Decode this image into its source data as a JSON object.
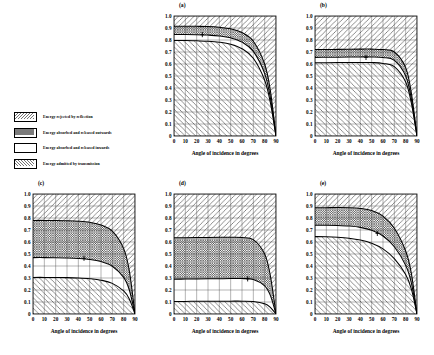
{
  "legend": {
    "items": [
      {
        "label": "Energy rejected by reflection",
        "pattern": "backslash-hatch"
      },
      {
        "label": "Energy absorbed and released outwards",
        "pattern": "cross-hatch"
      },
      {
        "label": "Energy absorbed and released inwards",
        "pattern": "solid-white"
      },
      {
        "label": "Energy admitted by transmission",
        "pattern": "forwardslash-hatch"
      }
    ]
  },
  "chart_data": [
    {
      "type": "area",
      "title": "(a)",
      "xlabel": "Angle of incidence in degrees",
      "ylabel": "",
      "xlim": [
        0,
        90
      ],
      "ylim": [
        0,
        1.0
      ],
      "xticks": [
        0,
        10,
        20,
        30,
        40,
        50,
        60,
        70,
        80,
        90
      ],
      "yticks": [
        0,
        0.1,
        0.2,
        0.3,
        0.4,
        0.5,
        0.6,
        0.7,
        0.8,
        0.9,
        1.0
      ],
      "ytick_labels": [
        "0",
        "0.1",
        "0.2",
        "0.3",
        "0.4",
        "0.5",
        "0.6",
        "0.7",
        "0.8",
        "0.9",
        "1.0"
      ],
      "grid": true,
      "x": [
        0,
        10,
        20,
        30,
        40,
        50,
        60,
        70,
        80,
        85,
        90
      ],
      "series": [
        {
          "name": "upper-boundary",
          "values": [
            0.915,
            0.915,
            0.914,
            0.912,
            0.906,
            0.893,
            0.862,
            0.79,
            0.6,
            0.38,
            0.0
          ]
        },
        {
          "name": "middle-boundary",
          "values": [
            0.845,
            0.845,
            0.844,
            0.841,
            0.834,
            0.818,
            0.782,
            0.705,
            0.52,
            0.32,
            0.0
          ]
        },
        {
          "name": "lower-boundary",
          "values": [
            0.795,
            0.795,
            0.793,
            0.79,
            0.782,
            0.765,
            0.727,
            0.648,
            0.465,
            0.28,
            0.0
          ]
        }
      ],
      "marker": {
        "x": 25,
        "y": 0.845
      }
    },
    {
      "type": "area",
      "title": "(b)",
      "xlabel": "Angle of incidence in degrees",
      "ylabel": "",
      "xlim": [
        0,
        90
      ],
      "ylim": [
        0,
        1.0
      ],
      "xticks": [
        0,
        10,
        20,
        30,
        40,
        50,
        60,
        70,
        80,
        90
      ],
      "yticks": [
        0,
        0.1,
        0.2,
        0.3,
        0.4,
        0.5,
        0.6,
        0.7,
        0.8,
        0.9,
        1.0
      ],
      "ytick_labels": [
        "0",
        "0.1",
        "0.2",
        "0.3",
        "0.4",
        "0.5",
        "0.6",
        "0.7",
        "0.8",
        "0.9",
        "1.0"
      ],
      "grid": true,
      "x": [
        0,
        10,
        20,
        30,
        40,
        50,
        60,
        70,
        80,
        85,
        90
      ],
      "series": [
        {
          "name": "upper-boundary",
          "values": [
            0.72,
            0.721,
            0.722,
            0.723,
            0.724,
            0.724,
            0.72,
            0.7,
            0.57,
            0.36,
            0.0
          ]
        },
        {
          "name": "middle-boundary",
          "values": [
            0.655,
            0.656,
            0.657,
            0.658,
            0.659,
            0.659,
            0.654,
            0.63,
            0.5,
            0.31,
            0.0
          ]
        },
        {
          "name": "lower-boundary",
          "values": [
            0.61,
            0.611,
            0.612,
            0.613,
            0.613,
            0.612,
            0.605,
            0.578,
            0.45,
            0.275,
            0.0
          ]
        }
      ],
      "marker": {
        "x": 45,
        "y": 0.655
      }
    },
    {
      "type": "area",
      "title": "(c)",
      "xlabel": "Angle of incidence in degrees",
      "ylabel": "",
      "xlim": [
        0,
        90
      ],
      "ylim": [
        0,
        1.0
      ],
      "xticks": [
        0,
        10,
        20,
        30,
        40,
        50,
        60,
        70,
        80,
        90
      ],
      "yticks": [
        0,
        0.1,
        0.2,
        0.3,
        0.4,
        0.5,
        0.6,
        0.7,
        0.8,
        0.9,
        1.0
      ],
      "ytick_labels": [
        "0",
        "0.1",
        "0.2",
        "0.3",
        "0.4",
        "0.5",
        "0.6",
        "0.7",
        "0.8",
        "0.9",
        "1.0"
      ],
      "grid": true,
      "x": [
        0,
        10,
        20,
        30,
        40,
        50,
        60,
        70,
        80,
        85,
        90
      ],
      "series": [
        {
          "name": "upper-boundary",
          "values": [
            0.78,
            0.78,
            0.779,
            0.777,
            0.773,
            0.764,
            0.742,
            0.69,
            0.545,
            0.36,
            0.0
          ]
        },
        {
          "name": "middle-boundary",
          "values": [
            0.47,
            0.47,
            0.469,
            0.467,
            0.463,
            0.455,
            0.437,
            0.398,
            0.305,
            0.2,
            0.0
          ]
        },
        {
          "name": "lower-boundary",
          "values": [
            0.305,
            0.305,
            0.304,
            0.303,
            0.3,
            0.294,
            0.282,
            0.255,
            0.192,
            0.125,
            0.0
          ]
        }
      ],
      "marker": {
        "x": 45,
        "y": 0.465
      }
    },
    {
      "type": "area",
      "title": "(d)",
      "xlabel": "Angle of incidence in degrees",
      "ylabel": "",
      "xlim": [
        0,
        90
      ],
      "ylim": [
        0,
        1.0
      ],
      "xticks": [
        0,
        10,
        20,
        30,
        40,
        50,
        60,
        70,
        80,
        90
      ],
      "yticks": [
        0,
        0.1,
        0.2,
        0.3,
        0.4,
        0.5,
        0.6,
        0.7,
        0.8,
        0.9,
        1.0
      ],
      "ytick_labels": [
        "0",
        "0.1",
        "0.2",
        "0.3",
        "0.4",
        "0.5",
        "0.6",
        "0.7",
        "0.8",
        "0.9",
        "1.0"
      ],
      "grid": true,
      "x": [
        0,
        10,
        20,
        30,
        40,
        50,
        60,
        70,
        80,
        85,
        90
      ],
      "series": [
        {
          "name": "upper-boundary",
          "values": [
            0.635,
            0.636,
            0.637,
            0.638,
            0.639,
            0.639,
            0.637,
            0.62,
            0.5,
            0.32,
            0.0
          ]
        },
        {
          "name": "middle-boundary",
          "values": [
            0.29,
            0.291,
            0.292,
            0.293,
            0.294,
            0.295,
            0.295,
            0.288,
            0.235,
            0.155,
            0.0
          ]
        },
        {
          "name": "lower-boundary",
          "values": [
            0.105,
            0.105,
            0.106,
            0.106,
            0.107,
            0.107,
            0.107,
            0.104,
            0.085,
            0.055,
            0.0
          ]
        }
      ],
      "marker": {
        "x": 65,
        "y": 0.293
      }
    },
    {
      "type": "area",
      "title": "(e)",
      "xlabel": "Angle of incidence in degrees",
      "ylabel": "",
      "xlim": [
        0,
        90
      ],
      "ylim": [
        0,
        1.0
      ],
      "xticks": [
        0,
        10,
        20,
        30,
        40,
        50,
        60,
        70,
        80,
        90
      ],
      "yticks": [
        0,
        0.1,
        0.2,
        0.3,
        0.4,
        0.5,
        0.6,
        0.7,
        0.8,
        0.9,
        1.0
      ],
      "ytick_labels": [
        "0",
        "0.1",
        "0.2",
        "0.3",
        "0.4",
        "0.5",
        "0.6",
        "0.7",
        "0.8",
        "0.9",
        "1.0"
      ],
      "grid": true,
      "x": [
        0,
        10,
        20,
        30,
        40,
        50,
        60,
        70,
        80,
        85,
        90
      ],
      "series": [
        {
          "name": "upper-boundary",
          "values": [
            0.885,
            0.886,
            0.887,
            0.886,
            0.88,
            0.862,
            0.815,
            0.715,
            0.525,
            0.34,
            0.0
          ]
        },
        {
          "name": "middle-boundary",
          "values": [
            0.74,
            0.74,
            0.738,
            0.733,
            0.722,
            0.698,
            0.65,
            0.56,
            0.405,
            0.26,
            0.0
          ]
        },
        {
          "name": "lower-boundary",
          "values": [
            0.645,
            0.644,
            0.64,
            0.632,
            0.617,
            0.59,
            0.543,
            0.462,
            0.33,
            0.21,
            0.0
          ]
        }
      ],
      "marker": {
        "x": 55,
        "y": 0.672
      }
    }
  ]
}
